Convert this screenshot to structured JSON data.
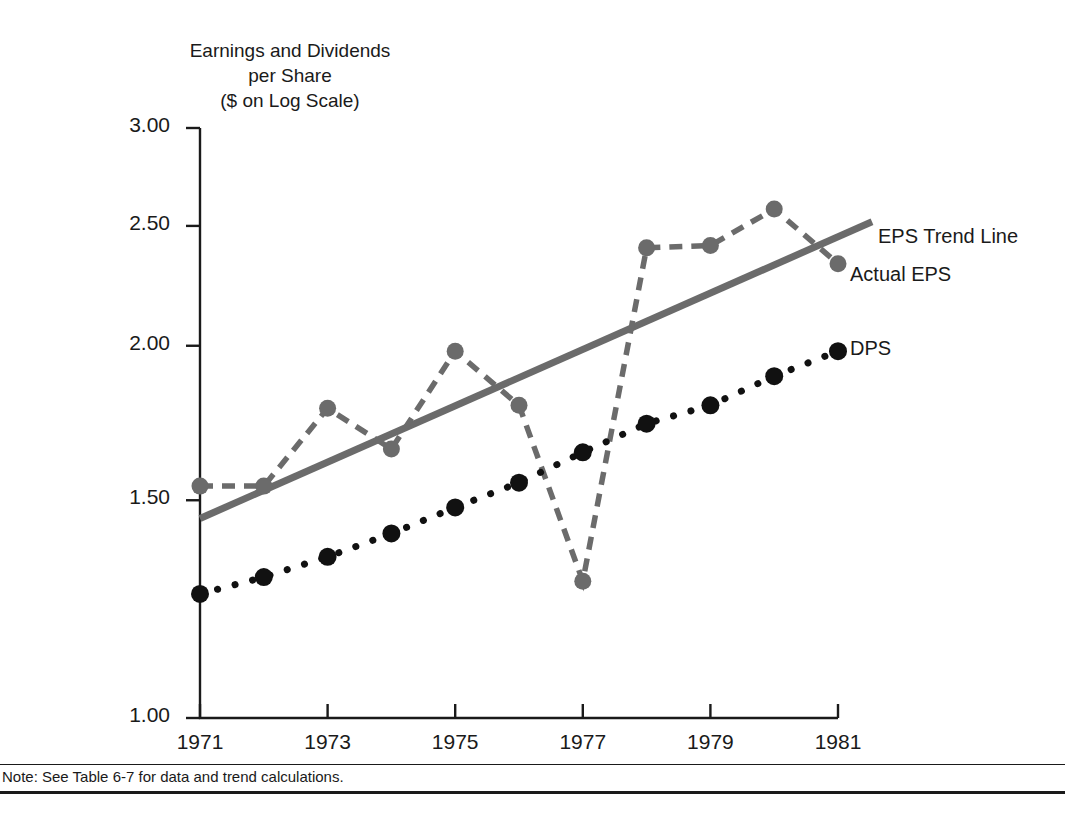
{
  "figure": {
    "axis_title": "Earnings and Dividends\nper Share\n($ on Log Scale)",
    "note": "Note: See Table 6-7 for data and trend calculations."
  },
  "labels": {
    "trend": "EPS Trend Line",
    "actual": "Actual EPS",
    "dps": "DPS"
  },
  "colors": {
    "eps_gray": "#6b6b6b",
    "dps_black": "#111111",
    "axis": "#1a1a1a",
    "background": "#ffffff"
  },
  "chart_data": {
    "type": "line",
    "title": "Earnings and Dividends per Share ($ on Log Scale)",
    "xlabel": "",
    "ylabel": "Earnings and Dividends per Share ($ on Log Scale)",
    "yscale": "log",
    "ylim": [
      1.0,
      3.0
    ],
    "ytick_labels": [
      "3.00",
      "2.50",
      "2.00",
      "1.50",
      "1.00"
    ],
    "ytick_values": [
      3.0,
      2.5,
      2.0,
      1.5,
      1.0
    ],
    "x": [
      1971,
      1972,
      1973,
      1974,
      1975,
      1976,
      1977,
      1978,
      1979,
      1980,
      1981
    ],
    "xtick_labels": [
      "1971",
      "1973",
      "1975",
      "1977",
      "1979",
      "1981"
    ],
    "xtick_values": [
      1971,
      1973,
      1975,
      1977,
      1979,
      1981
    ],
    "xlim": [
      1971,
      1981
    ],
    "grid": false,
    "legend_position": "inline-right",
    "series": [
      {
        "name": "Actual EPS",
        "style": "dashed-marker",
        "color": "#6b6b6b",
        "values": [
          1.54,
          1.54,
          1.78,
          1.65,
          1.98,
          1.79,
          1.29,
          2.4,
          2.41,
          2.58,
          2.33
        ]
      },
      {
        "name": "DPS",
        "style": "dotted-marker",
        "color": "#111111",
        "values": [
          1.26,
          1.3,
          1.35,
          1.41,
          1.48,
          1.55,
          1.64,
          1.73,
          1.79,
          1.89,
          1.98
        ]
      },
      {
        "name": "EPS Trend Line",
        "style": "solid",
        "color": "#6b6b6b",
        "endpoints": [
          1.45,
          2.45
        ],
        "values": [
          1.45,
          1.54,
          1.63,
          1.73,
          1.84,
          1.95,
          2.07,
          2.19,
          2.32,
          2.46,
          2.61
        ]
      }
    ]
  }
}
